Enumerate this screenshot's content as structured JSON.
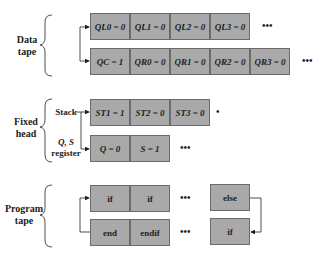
{
  "sections": {
    "data_tape": {
      "label_line1": "Data",
      "label_line2": "tape",
      "row1": [
        "QL0 = 0",
        "QL1 = 0",
        "QL2 = 0",
        "QL3 = 0"
      ],
      "row2": [
        "QC = 1",
        "QR0 = 0",
        "QR1 = 0",
        "QR2 = 0",
        "QR3 = 0"
      ]
    },
    "fixed_head": {
      "label_line1": "Fixed",
      "label_line2": "head",
      "stack_label": "Stack",
      "qs_label_line1": "Q, S",
      "qs_label_line2": "register",
      "stack": [
        "ST1 = 1",
        "ST2 = 0",
        "ST3 = 0"
      ],
      "registers": [
        "Q = 0",
        "S = 1"
      ]
    },
    "program_tape": {
      "label_line1": "Program",
      "label_line2": "tape",
      "row1": [
        "if",
        "if"
      ],
      "row1_end": "else",
      "row2": [
        "end",
        "endif"
      ],
      "row2_end": "if"
    }
  },
  "ellipsis": "•••"
}
